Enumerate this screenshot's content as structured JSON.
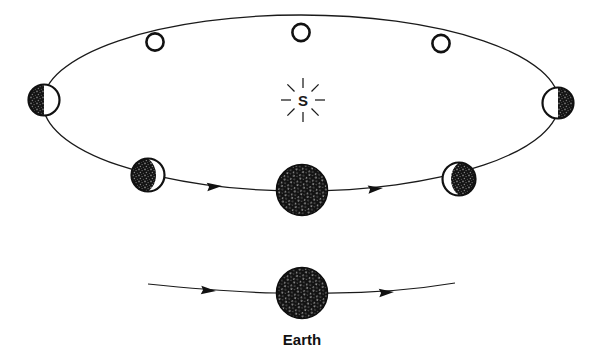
{
  "diagram": {
    "type": "astronomy-orbit-diagram",
    "background_color": "#ffffff",
    "ink_color": "#111111",
    "sun": {
      "label": "S",
      "name": "sun-symbol",
      "center": [
        303,
        100
      ],
      "ray_count": 8,
      "ray_inner_radius": 12,
      "ray_outer_radius": 22
    },
    "orbit": {
      "name": "moon-orbit-ellipse",
      "center": [
        301,
        103
      ],
      "rx": 258,
      "ry": 88,
      "stroke_width": 1.2,
      "stroke": "#1a1a1a"
    },
    "earth_center": {
      "name": "earth-center-body",
      "center": [
        302,
        190
      ],
      "radius": 26,
      "fill": "#141414",
      "texture": "stippled"
    },
    "moons": [
      {
        "name": "moon-new-top-left",
        "phase": "new",
        "center": [
          155,
          42
        ],
        "radius": 9,
        "lit_side": "none",
        "description": "hollow outlined circle"
      },
      {
        "name": "moon-new-top-center",
        "phase": "new",
        "center": [
          301,
          33
        ],
        "radius": 9,
        "lit_side": "none",
        "description": "hollow outlined circle"
      },
      {
        "name": "moon-new-top-right",
        "phase": "new",
        "center": [
          441,
          44
        ],
        "radius": 9,
        "lit_side": "none",
        "description": "hollow outlined circle"
      },
      {
        "name": "moon-half-left",
        "phase": "half",
        "center": [
          44,
          100
        ],
        "radius": 16,
        "lit_side": "right",
        "description": "dark left half, light right half"
      },
      {
        "name": "moon-half-right",
        "phase": "half",
        "center": [
          558,
          103
        ],
        "radius": 16,
        "lit_side": "left",
        "description": "light left half, dark right half"
      },
      {
        "name": "moon-crescent-lower-left",
        "phase": "crescent",
        "center": [
          148,
          175
        ],
        "radius": 17,
        "lit_side": "right",
        "description": "mostly dark with light crescent on right"
      },
      {
        "name": "moon-crescent-lower-right",
        "phase": "crescent",
        "center": [
          459,
          179
        ],
        "radius": 17,
        "lit_side": "left",
        "description": "light crescent on left, dark right"
      }
    ],
    "orbit_arrows": [
      {
        "name": "orbit-direction-arrow-left",
        "at": [
          222,
          186
        ],
        "direction": "right"
      },
      {
        "name": "orbit-direction-arrow-right",
        "at": [
          383,
          188
        ],
        "direction": "right"
      }
    ],
    "bottom_track": {
      "name": "earth-travel-path",
      "left_end": [
        148,
        283
      ],
      "right_end": [
        455,
        283
      ],
      "earth": {
        "name": "earth-bottom-body",
        "center": [
          302,
          293
        ],
        "radius": 26,
        "fill": "#141414",
        "texture": "stippled"
      },
      "label": "Earth",
      "label_position": [
        302,
        345
      ],
      "arrows": [
        {
          "name": "earth-direction-arrow-left",
          "at": [
            215,
            291
          ],
          "direction": "right"
        },
        {
          "name": "earth-direction-arrow-right",
          "at": [
            393,
            292
          ],
          "direction": "right"
        }
      ]
    }
  }
}
